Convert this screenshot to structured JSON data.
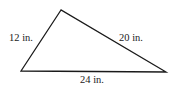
{
  "diagram": {
    "type": "triangle",
    "vertices": {
      "top": [
        61,
        10
      ],
      "bottom_left": [
        21,
        71
      ],
      "bottom_right": [
        166,
        72
      ]
    },
    "sides": {
      "left": {
        "label": "12 in.",
        "length": 12,
        "unit": "in."
      },
      "right": {
        "label": "20 in.",
        "length": 20,
        "unit": "in."
      },
      "bottom": {
        "label": "24 in.",
        "length": 24,
        "unit": "in."
      }
    },
    "stroke_color": "#1a1a1a",
    "background": "#ffffff"
  }
}
